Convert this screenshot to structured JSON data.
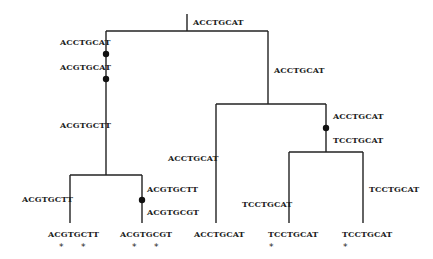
{
  "tree": {
    "root": {
      "sequence": "ACCTGCAT"
    },
    "nodes": [
      {
        "id": "n_left",
        "branch_labels": [
          "ACCTGCAT",
          "ACGTGCAT",
          "ACGTGCTT"
        ],
        "mutation_points": 2
      },
      {
        "id": "n_leftleft",
        "branch_labels": [
          "ACGTGCTT"
        ],
        "mutation_points": 0
      },
      {
        "id": "n_leftright",
        "branch_labels": [
          "ACGTGCTT",
          "ACGTGCGT"
        ],
        "mutation_points": 1
      },
      {
        "id": "n_right",
        "branch_labels": [
          "ACCTGCAT"
        ],
        "mutation_points": 0
      },
      {
        "id": "n_rightleft",
        "branch_labels": [
          "ACCTGCAT"
        ],
        "mutation_points": 0
      },
      {
        "id": "n_rightright",
        "branch_labels": [
          "ACCTGCAT",
          "TCCTGCAT"
        ],
        "mutation_points": 1
      },
      {
        "id": "n_rrl",
        "branch_labels": [
          "TCCTGCAT"
        ],
        "mutation_points": 0
      },
      {
        "id": "n_rrr",
        "branch_labels": [
          "TCCTGCAT"
        ],
        "mutation_points": 0
      }
    ],
    "leaves": [
      {
        "sequence": "ACGTGCTT",
        "stars": "*    *"
      },
      {
        "sequence": "ACGTGCGT",
        "stars": "*    *"
      },
      {
        "sequence": "ACCTGCAT",
        "stars": ""
      },
      {
        "sequence": "TCCTGCAT",
        "stars": "*"
      },
      {
        "sequence": "TCCTGCAT",
        "stars": "*"
      }
    ]
  }
}
